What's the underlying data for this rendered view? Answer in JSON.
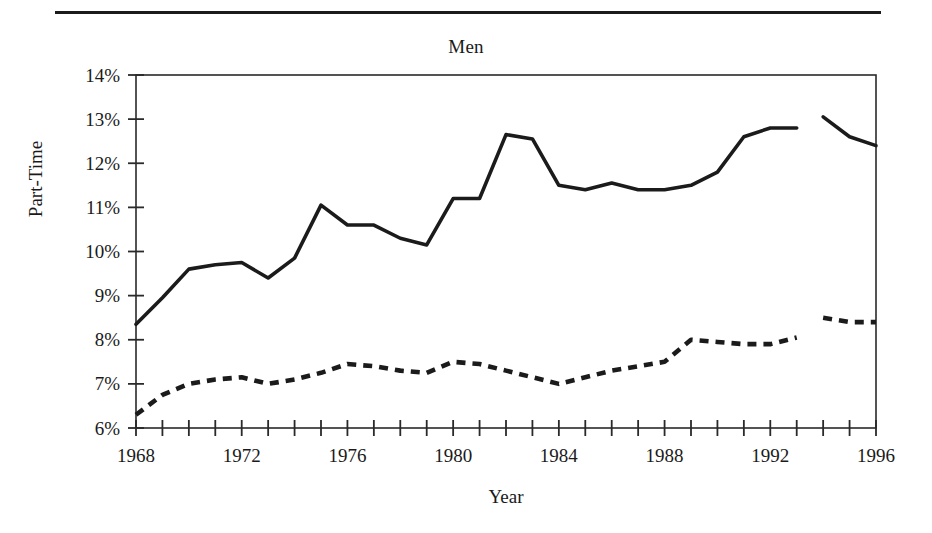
{
  "chart_data": {
    "type": "line",
    "title": "Men",
    "xlabel": "Year",
    "ylabel": "Part-Time",
    "grid": false,
    "legend": "none",
    "xlim": [
      1968,
      1996
    ],
    "ylim": [
      6,
      14
    ],
    "y_tick_labels": [
      "6%",
      "7%",
      "8%",
      "9%",
      "10%",
      "11%",
      "12%",
      "13%",
      "14%"
    ],
    "y_tick_values": [
      6,
      7,
      8,
      9,
      10,
      11,
      12,
      13,
      14
    ],
    "x_tick_labels": [
      "1968",
      "1972",
      "1976",
      "1980",
      "1984",
      "1988",
      "1992",
      "1996"
    ],
    "x_tick_values": [
      1968,
      1972,
      1976,
      1980,
      1984,
      1988,
      1992,
      1996
    ],
    "x_minor_tick_interval": 1,
    "y_unit": "percent",
    "x": [
      1968,
      1969,
      1970,
      1971,
      1972,
      1973,
      1974,
      1975,
      1976,
      1977,
      1978,
      1979,
      1980,
      1981,
      1982,
      1983,
      1984,
      1985,
      1986,
      1987,
      1988,
      1989,
      1990,
      1991,
      1992,
      1993,
      1994,
      1995,
      1996
    ],
    "series": [
      {
        "name": "solid-series",
        "style": "solid",
        "color": "#1b1b1b",
        "break_after_year": 1993,
        "values": [
          8.35,
          8.95,
          9.6,
          9.7,
          9.75,
          9.4,
          9.85,
          11.05,
          10.6,
          10.6,
          10.3,
          10.15,
          11.2,
          11.2,
          12.65,
          12.55,
          11.5,
          11.4,
          11.55,
          11.4,
          11.4,
          11.5,
          11.8,
          12.6,
          12.8,
          12.8,
          13.05,
          12.6,
          12.4
        ]
      },
      {
        "name": "dashed-series",
        "style": "dashed",
        "color": "#1b1b1b",
        "break_after_year": 1993,
        "values": [
          6.3,
          6.75,
          7.0,
          7.1,
          7.15,
          7.0,
          7.1,
          7.25,
          7.45,
          7.4,
          7.3,
          7.25,
          7.5,
          7.45,
          7.3,
          7.15,
          7.0,
          7.15,
          7.3,
          7.4,
          7.5,
          8.0,
          7.95,
          7.9,
          7.9,
          8.05,
          8.5,
          8.4,
          8.4
        ]
      }
    ]
  },
  "figure": {
    "title": "Men",
    "x_axis_label": "Year",
    "y_axis_label": "Part-Time"
  }
}
